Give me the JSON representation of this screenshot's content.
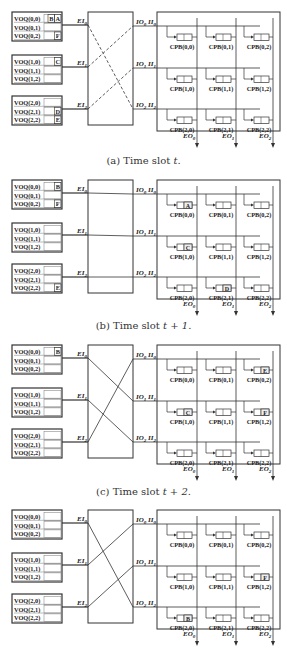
{
  "figure": {
    "panels": [
      {
        "id": "a",
        "caption": "(a) Time slot t.",
        "caption_prefix": "(a) Time slot ",
        "caption_var": "t.",
        "switch_style": "dashed",
        "connections": [
          [
            0,
            2
          ],
          [
            1,
            0
          ],
          [
            2,
            1
          ]
        ],
        "voq_cells": {
          "VOQ(0,0)": [
            "B",
            "A"
          ],
          "VOQ(0,1)": [],
          "VOQ(0,2)": [
            "F"
          ],
          "VOQ(1,0)": [
            "C"
          ],
          "VOQ(1,1)": [],
          "VOQ(1,2)": [],
          "VOQ(2,0)": [],
          "VOQ(2,1)": [
            "D"
          ],
          "VOQ(2,2)": [
            "E"
          ]
        },
        "cpb_cells": {}
      },
      {
        "id": "b",
        "caption": "(b) Time slot t + 1.",
        "caption_prefix": "(b) Time slot ",
        "caption_var": "t + 1.",
        "switch_style": "none",
        "connections": [
          [
            0,
            0
          ],
          [
            1,
            1
          ],
          [
            2,
            2
          ]
        ],
        "voq_cells": {
          "VOQ(0,0)": [
            "B"
          ],
          "VOQ(0,2)": [
            "F"
          ],
          "VOQ(2,2)": [
            "E"
          ]
        },
        "cpb_cells": {
          "CPB(0,0)": "A",
          "CPB(1,0)": "C",
          "CPB(2,1)": "D"
        }
      },
      {
        "id": "c",
        "caption": "(c) Time slot t + 2.",
        "caption_prefix": "(c) Time slot ",
        "caption_var": "t + 2.",
        "switch_style": "solid",
        "connections": [
          [
            0,
            1
          ],
          [
            1,
            2
          ],
          [
            2,
            0
          ]
        ],
        "voq_cells": {
          "VOQ(0,0)": [
            "B"
          ]
        },
        "cpb_cells": {
          "CPB(0,2)": "E",
          "CPB(1,0)": "C",
          "CPB(1,2)": "F"
        }
      },
      {
        "id": "d",
        "caption": "",
        "switch_style": "solid",
        "connections": [
          [
            0,
            2
          ],
          [
            1,
            0
          ],
          [
            2,
            1
          ]
        ],
        "voq_cells": {},
        "cpb_cells": {
          "CPB(1,2)": "F",
          "CPB(2,0)": "B"
        }
      }
    ],
    "labels": {
      "voq": [
        [
          "VOQ(0,0)",
          "VOQ(0,1)",
          "VOQ(0,2)"
        ],
        [
          "VOQ(1,0)",
          "VOQ(1,1)",
          "VOQ(1,2)"
        ],
        [
          "VOQ(2,0)",
          "VOQ(2,1)",
          "VOQ(2,2)"
        ]
      ],
      "ei": [
        "EI",
        "EI",
        "EI"
      ],
      "ei_sub": [
        "0",
        "1",
        "2"
      ],
      "io": [
        "IO",
        "IO",
        "IO"
      ],
      "io_sub": [
        "0",
        "1",
        "2"
      ],
      "ii": [
        "II",
        "II",
        "II"
      ],
      "ii_sub": [
        "0",
        "1",
        "2"
      ],
      "eo": [
        "EO",
        "EO",
        "EO"
      ],
      "eo_sub": [
        "0",
        "1",
        "2"
      ],
      "cpb": [
        [
          "CPB(0,0)",
          "CPB(0,1)",
          "CPB(0,2)"
        ],
        [
          "CPB(1,0)",
          "CPB(1,1)",
          "CPB(1,2)"
        ],
        [
          "CPB(2,0)",
          "CPB(2,1)",
          "CPB(2,2)"
        ]
      ]
    },
    "colors": {
      "line": "#333333",
      "text": "#222222",
      "background": "#ffffff"
    }
  }
}
